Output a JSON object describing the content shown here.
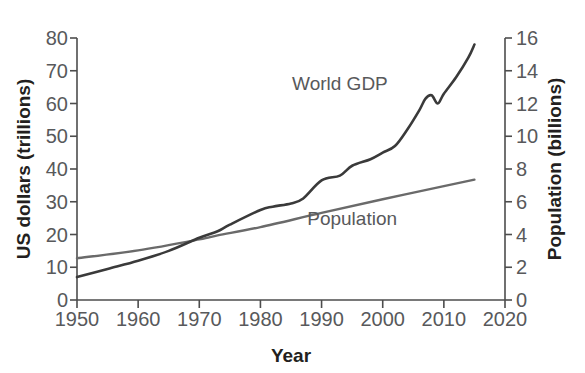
{
  "chart_data": {
    "type": "line",
    "title": "",
    "xlabel": "Year",
    "ylabel": "US dollars (trillions)",
    "y2label": "Population (billions)",
    "xlim": [
      1950,
      2020
    ],
    "ylim": [
      0,
      80
    ],
    "y2lim": [
      0,
      16
    ],
    "grid": false,
    "legend_position": "inline-annotations",
    "x_ticks": [
      1950,
      1960,
      1970,
      1980,
      1990,
      2000,
      2010,
      2020
    ],
    "y_ticks": [
      0,
      10,
      20,
      30,
      40,
      50,
      60,
      70,
      80
    ],
    "y2_ticks": [
      0,
      2,
      4,
      6,
      8,
      10,
      12,
      14,
      16
    ],
    "annotations": [
      {
        "text": "World GDP",
        "x": 1993,
        "y": 64
      },
      {
        "text": "Population",
        "x": 1995,
        "y": 23
      }
    ],
    "series": [
      {
        "name": "World GDP",
        "axis": "left",
        "units": "trillions US dollars",
        "color": "#3a3a3a",
        "x": [
          1950,
          1955,
          1960,
          1965,
          1970,
          1973,
          1975,
          1980,
          1982,
          1985,
          1987,
          1990,
          1993,
          1995,
          1998,
          2000,
          2002,
          2004,
          2006,
          2007,
          2008,
          2009,
          2010,
          2012,
          2014,
          2015
        ],
        "values": [
          7,
          9.5,
          12,
          15,
          19,
          21,
          23,
          27.5,
          28.5,
          29.5,
          31,
          36.5,
          38,
          41,
          43,
          45,
          47,
          52,
          58,
          61.5,
          62.5,
          60,
          63,
          68,
          74,
          78
        ]
      },
      {
        "name": "Population",
        "axis": "right",
        "units": "billions",
        "color": "#6a6a6a",
        "x": [
          1950,
          1960,
          1970,
          1973,
          1980,
          1990,
          2000,
          2010,
          2015
        ],
        "values": [
          2.55,
          3.03,
          3.7,
          3.95,
          4.45,
          5.32,
          6.15,
          6.95,
          7.35
        ]
      }
    ]
  },
  "axes": {
    "left_title": "US dollars (trillions)",
    "right_title": "Population (billions)",
    "x_title": "Year"
  }
}
